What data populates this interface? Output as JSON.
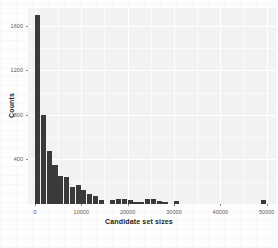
{
  "chart_data": {
    "type": "bar",
    "title": "",
    "subtitle": "",
    "xlabel": "Candidate set sizes",
    "ylabel": "Counts",
    "grid": true,
    "legend": "none",
    "xlim": [
      -1500,
      52000
    ],
    "ylim": [
      0,
      1760
    ],
    "xticks": [
      0,
      10000,
      20000,
      30000,
      40000,
      50000
    ],
    "xtick_labels": [
      "0",
      "10000",
      "20000",
      "30000",
      "40000",
      "50000"
    ],
    "yticks": [
      400,
      800,
      1200,
      1600
    ],
    "ytick_labels": [
      "400",
      "800",
      "1200",
      "1600"
    ],
    "bin_width": 1250,
    "bar_color": "#3a3a3a",
    "panel_color": "#f2f2f2",
    "grid_color": "#ffffff",
    "x": [
      625,
      1875,
      3125,
      4375,
      5625,
      6875,
      8125,
      9375,
      10625,
      11875,
      13125,
      14375,
      15625,
      16875,
      18125,
      19375,
      20625,
      21875,
      23125,
      24375,
      25625,
      26875,
      28125,
      29375,
      30625,
      31875,
      33125,
      34375,
      35625,
      36875,
      38125,
      39375,
      40625,
      41875,
      43125,
      44375,
      45625,
      46875,
      48125,
      49375,
      50625
    ],
    "values": [
      1700,
      800,
      480,
      350,
      255,
      245,
      150,
      170,
      125,
      90,
      75,
      40,
      0,
      40,
      42,
      45,
      40,
      20,
      15,
      45,
      44,
      30,
      10,
      0,
      30,
      0,
      0,
      0,
      0,
      0,
      0,
      0,
      0,
      0,
      0,
      0,
      0,
      0,
      0,
      32,
      0
    ]
  },
  "axis": {
    "x_title": "Candidate set sizes",
    "y_title": "Counts"
  }
}
